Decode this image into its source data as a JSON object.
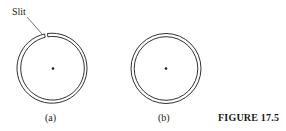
{
  "figure": {
    "caption": "FIGURE 17.5",
    "panels": [
      {
        "label": "(a)",
        "annotation": "Slit",
        "has_slit": true
      },
      {
        "label": "(b)",
        "has_slit": false
      }
    ]
  },
  "colors": {
    "stroke": "#1a1a1a",
    "background": "#ffffff"
  }
}
